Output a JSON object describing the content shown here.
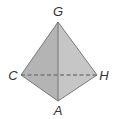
{
  "diagram": {
    "type": "tetrahedron",
    "vertices": [
      {
        "id": "G",
        "label": "G",
        "x": 58,
        "y": 22
      },
      {
        "id": "C",
        "label": "C",
        "x": 21,
        "y": 75
      },
      {
        "id": "H",
        "label": "H",
        "x": 97,
        "y": 75
      },
      {
        "id": "A",
        "label": "A",
        "x": 58,
        "y": 101
      }
    ],
    "edges_visible": [
      "G-C",
      "G-A",
      "G-H",
      "C-A",
      "A-H"
    ],
    "edges_hidden": [
      "C-H"
    ],
    "colors": {
      "left_face": "#b4b4b4",
      "right_face": "#c6c6c6",
      "edge": "#6e6e6e",
      "hidden_edge": "#7a7a7a",
      "label": "#333333"
    }
  }
}
